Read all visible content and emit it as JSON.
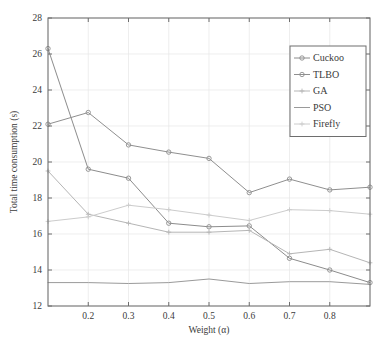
{
  "chart_data": {
    "type": "line",
    "title": "",
    "xlabel": "Weight (α)",
    "ylabel": "Total time consumption (s)",
    "xlim": [
      0.1,
      0.9
    ],
    "ylim": [
      12,
      28
    ],
    "xticks": [
      0.2,
      0.3,
      0.4,
      0.5,
      0.6,
      0.7,
      0.8
    ],
    "xtick_labels": [
      "0.2",
      "0.3",
      "0.4",
      "0.5",
      "0.6",
      "0.7",
      "0.8"
    ],
    "yticks": [
      12,
      14,
      16,
      18,
      20,
      22,
      24,
      26,
      28
    ],
    "ytick_labels": [
      "12",
      "14",
      "16",
      "18",
      "20",
      "22",
      "24",
      "26",
      "28"
    ],
    "grid": true,
    "legend_position": "upper right",
    "x": [
      0.1,
      0.2,
      0.3,
      0.4,
      0.5,
      0.6,
      0.7,
      0.8,
      0.9
    ],
    "series": [
      {
        "name": "Cuckoo",
        "color": "#8c8c8c",
        "marker": "circle",
        "values": [
          26.3,
          19.6,
          19.1,
          16.6,
          16.4,
          16.45,
          14.65,
          14.0,
          13.3
        ]
      },
      {
        "name": "TLBO",
        "color": "#8f8f8f",
        "marker": "circle",
        "values": [
          22.1,
          22.75,
          20.95,
          20.55,
          20.2,
          18.3,
          19.05,
          18.45,
          18.6
        ]
      },
      {
        "name": "GA",
        "color": "#b5b5b5",
        "marker": "plus",
        "values": [
          19.5,
          17.1,
          16.6,
          16.1,
          16.1,
          16.2,
          14.9,
          15.15,
          14.4
        ]
      },
      {
        "name": "PSO",
        "color": "#9a9a9a",
        "marker": "none",
        "values": [
          13.3,
          13.3,
          13.25,
          13.3,
          13.5,
          13.25,
          13.35,
          13.35,
          13.2
        ]
      },
      {
        "name": "Firefly",
        "color": "#cccccc",
        "marker": "plus",
        "values": [
          16.7,
          16.95,
          17.6,
          17.35,
          17.05,
          16.75,
          17.35,
          17.3,
          17.1
        ]
      }
    ]
  },
  "axis": {
    "x_title": "Weight (α)",
    "y_title": "Total time consumption (s)"
  },
  "legend": {
    "entries": [
      {
        "label": "Cuckoo"
      },
      {
        "label": "TLBO"
      },
      {
        "label": "GA"
      },
      {
        "label": "PSO"
      },
      {
        "label": "Firefly"
      }
    ]
  },
  "colors": {
    "axis": "#6e6e6e",
    "grid": "#e6e6e6",
    "background": "#ffffff",
    "text": "#3a3a3a"
  }
}
